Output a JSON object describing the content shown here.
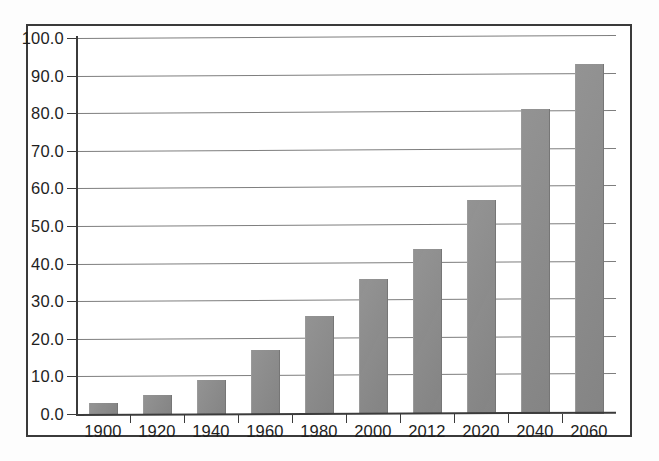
{
  "chart_data": {
    "type": "bar",
    "title": "",
    "xlabel": "",
    "ylabel": "",
    "categories": [
      "1900",
      "1920",
      "1940",
      "1960",
      "1980",
      "2000",
      "2012",
      "2020",
      "2040",
      "2060"
    ],
    "values": [
      3,
      5,
      9,
      17,
      26,
      36,
      44,
      57,
      81,
      93
    ],
    "ylim": [
      0,
      100
    ],
    "ytick_labels": [
      "0.0",
      "10.0",
      "20.0",
      "30.0",
      "40.0",
      "50.0",
      "60.0",
      "70.0",
      "80.0",
      "90.0",
      "100.0"
    ],
    "ytick_values": [
      0,
      10,
      20,
      30,
      40,
      50,
      60,
      70,
      80,
      90,
      100
    ],
    "grid": true,
    "legend": "none",
    "series": [
      {
        "name": "",
        "values": [
          3,
          5,
          9,
          17,
          26,
          36,
          44,
          57,
          81,
          93
        ]
      }
    ]
  },
  "style": {
    "bar_color": "#8b8b8b",
    "grid_color": "#7e7e7e",
    "axis_color": "#3b3b3b",
    "frame_color": "#3a3a3a",
    "text_color": "#1e1e1e",
    "background": "#ffffff"
  }
}
